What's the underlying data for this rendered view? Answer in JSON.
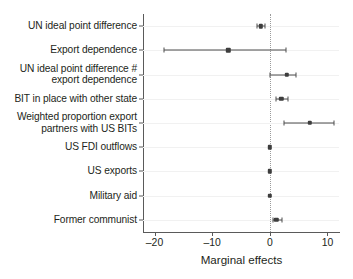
{
  "chart_data": {
    "type": "scatter",
    "title": "",
    "subtitle": "",
    "xlabel": "Marginal effects",
    "ylabel": "",
    "xlim": [
      -22.0,
      12.0
    ],
    "xticks": [
      -20,
      -10,
      0,
      10
    ],
    "xtick_labels": [
      "–20",
      "–10",
      "0",
      "10"
    ],
    "grid": false,
    "legend": null,
    "reference_line": 0,
    "orientation": "horizontal",
    "categories": [
      "UN ideal point difference",
      "Export dependence",
      "UN ideal point difference #\nexport dependence",
      "BIT in place with other state",
      "Weighted proportion export\npartners with US BITs",
      "US FDI outflows",
      "US exports",
      "Military aid",
      "Former communist"
    ],
    "values": [
      -1.6,
      -7.2,
      2.9,
      2.0,
      6.9,
      0.0,
      0.0,
      0.0,
      1.1
    ],
    "ci_low": [
      -2.2,
      -18.4,
      0.0,
      1.0,
      2.4,
      0.0,
      0.0,
      0.0,
      0.5
    ],
    "ci_high": [
      -0.9,
      2.8,
      4.5,
      3.1,
      11.2,
      0.0,
      0.0,
      0.0,
      2.1
    ],
    "points": [
      {
        "label": "UN ideal point difference",
        "estimate": -1.6,
        "ci_low": -2.2,
        "ci_high": -0.9
      },
      {
        "label": "Export dependence",
        "estimate": -7.2,
        "ci_low": -18.4,
        "ci_high": 2.8
      },
      {
        "label": "UN ideal point difference # export dependence",
        "estimate": 2.9,
        "ci_low": 0.0,
        "ci_high": 4.5
      },
      {
        "label": "BIT in place with other state",
        "estimate": 2.0,
        "ci_low": 1.0,
        "ci_high": 3.1
      },
      {
        "label": "Weighted proportion export partners with US BITs",
        "estimate": 6.9,
        "ci_low": 2.4,
        "ci_high": 11.2
      },
      {
        "label": "US FDI outflows",
        "estimate": 0.0,
        "ci_low": 0.0,
        "ci_high": 0.0
      },
      {
        "label": "US exports",
        "estimate": 0.0,
        "ci_low": 0.0,
        "ci_high": 0.0
      },
      {
        "label": "Military aid",
        "estimate": 0.0,
        "ci_low": 0.0,
        "ci_high": 0.0
      },
      {
        "label": "Former communist",
        "estimate": 1.1,
        "ci_low": 0.5,
        "ci_high": 2.1
      }
    ],
    "colors": {
      "marker": "#3d3d3d",
      "ci": "#4c4c4c",
      "axis": "#5a5a5a",
      "zero_line": "#9b9b9b",
      "text": "#231f20",
      "background": "#ffffff"
    }
  }
}
